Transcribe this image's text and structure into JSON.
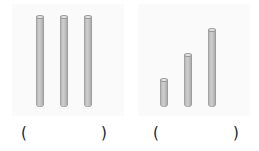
{
  "figure": {
    "groups": [
      {
        "name": "equal-rods",
        "rods": [
          {
            "x": 40,
            "top": 17,
            "bottom": 107
          },
          {
            "x": 64,
            "top": 17,
            "bottom": 107
          },
          {
            "x": 88,
            "top": 17,
            "bottom": 107
          }
        ],
        "answer": {
          "open": "(",
          "close": ")"
        }
      },
      {
        "name": "increasing-rods",
        "rods": [
          {
            "x": 164,
            "top": 80,
            "bottom": 107
          },
          {
            "x": 188,
            "top": 55,
            "bottom": 107
          },
          {
            "x": 212,
            "top": 30,
            "bottom": 107
          }
        ],
        "answer": {
          "open": "(",
          "close": ")"
        }
      }
    ],
    "colors": {
      "rod": "#bdbdbd",
      "rod_outline": "#999999",
      "panel": "#fafafa",
      "text": "#222222"
    }
  }
}
